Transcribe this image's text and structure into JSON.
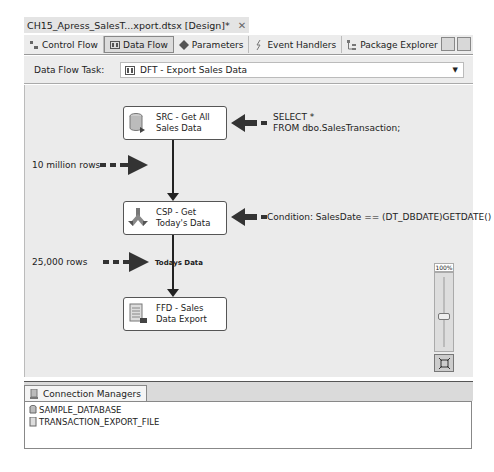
{
  "document_tab": {
    "title": "CH15_Apress_SalesT...xport.dtsx [Design]*",
    "close": "✕"
  },
  "designer_tabs": [
    {
      "label": "Control Flow",
      "icon": "control-flow-icon",
      "active": false
    },
    {
      "label": "Data Flow",
      "icon": "data-flow-icon",
      "active": true
    },
    {
      "label": "Parameters",
      "icon": "parameters-icon",
      "active": false
    },
    {
      "label": "Event Handlers",
      "icon": "event-handlers-icon",
      "active": false
    },
    {
      "label": "Package Explorer",
      "icon": "package-explorer-icon",
      "active": false
    }
  ],
  "task_bar": {
    "label": "Data Flow Task:",
    "selected": "DFT - Export Sales Data"
  },
  "nodes": [
    {
      "name": "SRC - Get All Sales Data",
      "line1": "SRC - Get All",
      "line2": "Sales Data",
      "icon": "database-source-icon"
    },
    {
      "name": "CSP - Get Today's Data",
      "line1": "CSP - Get",
      "line2": "Today's Data",
      "icon": "conditional-split-icon"
    },
    {
      "name": "FFD - Sales Data Export",
      "line1": "FFD - Sales",
      "line2": "Data Export",
      "icon": "flat-file-destination-icon"
    }
  ],
  "path_label": "Todays Data",
  "annotations": {
    "sql_line1": "SELECT *",
    "sql_line2": "FROM dbo.SalesTransaction;",
    "condition": "Condition: SalesDate == (DT_DBDATE)GETDATE()",
    "rows_in": "10 million rows",
    "rows_out": "25,000 rows"
  },
  "zoom": {
    "level": "100%"
  },
  "connection_managers": {
    "tab_label": "Connection Managers",
    "items": [
      "SAMPLE_DATABASE",
      "TRANSACTION_EXPORT_FILE"
    ]
  }
}
